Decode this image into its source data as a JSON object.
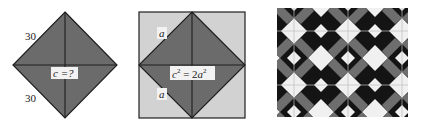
{
  "figures": [
    {
      "id": "diamond",
      "fill": "#6b6b6b",
      "stroke": "#1e1e1e",
      "labels": {
        "upper_side": "30",
        "lower_side": "30",
        "hypotenuse": "c =?"
      }
    },
    {
      "id": "square-with-diamond",
      "outer_fill": "#d2d2d2",
      "inner_fill": "#6b6b6b",
      "stroke": "#1e1e1e",
      "labels": {
        "upper_side": "a",
        "lower_side": "a",
        "equation_lhs": "c",
        "equation_lhs_exp": "2",
        "equation_eq": " = 2",
        "equation_rhs": "a",
        "equation_rhs_exp": "2"
      }
    },
    {
      "id": "tile-photo",
      "description": "black and white geometric tile pattern",
      "dark": "#141414",
      "mid": "#6e6e6e",
      "light": "#f0f0f0"
    }
  ]
}
